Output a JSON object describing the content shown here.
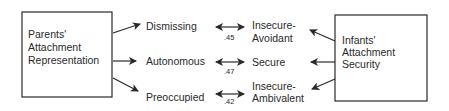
{
  "left_box": {
    "lines": [
      "Parents'",
      "Attachment",
      "Representation"
    ]
  },
  "right_box": {
    "lines": [
      "Infants'",
      "Attachment",
      "Security"
    ]
  },
  "parent_categories": [
    {
      "label": "Dismissing"
    },
    {
      "label": "Autonomous"
    },
    {
      "label": "Preoccupied"
    }
  ],
  "infant_categories": [
    {
      "lines": [
        "Insecure-",
        "Avoidant"
      ]
    },
    {
      "lines": [
        "Secure"
      ]
    },
    {
      "lines": [
        "Insecure-",
        "Ambivalent"
      ]
    }
  ],
  "correlations": [
    ".45",
    ".47",
    ".42"
  ],
  "colors": {
    "ink": "#2a2a2a",
    "background": "#ffffff"
  }
}
